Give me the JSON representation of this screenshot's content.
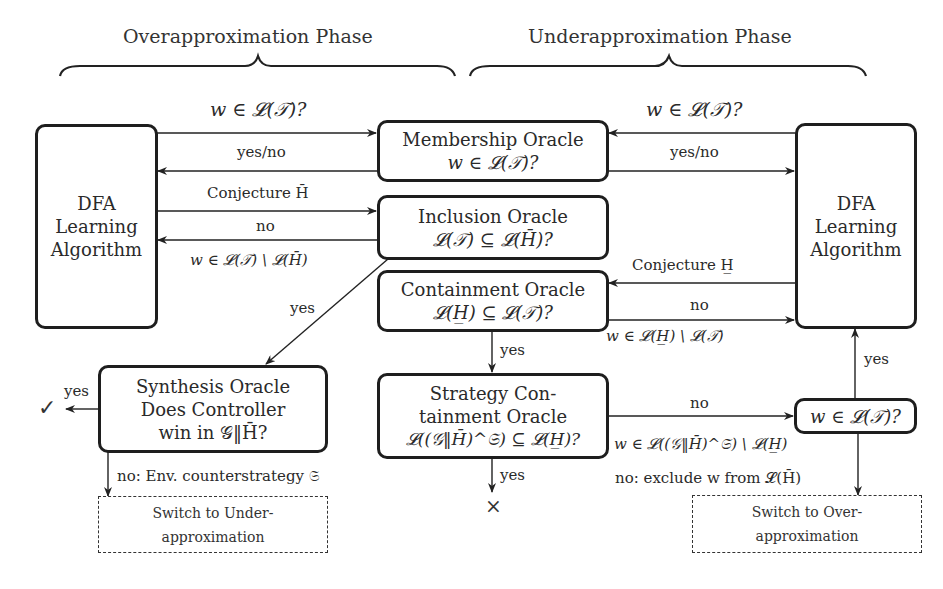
{
  "phases": {
    "over": "Overapproximation Phase",
    "under": "Underapproximation Phase"
  },
  "boxes": {
    "dfa_left": [
      "DFA",
      "Learning",
      "Algorithm"
    ],
    "dfa_right": [
      "DFA",
      "Learning",
      "Algorithm"
    ],
    "membership": [
      "Membership Oracle",
      "w ∈ 𝓛(𝒯)?"
    ],
    "inclusion": [
      "Inclusion Oracle",
      "𝓛(𝒯) ⊆ 𝓛(H̄)?"
    ],
    "containment": [
      "Containment Oracle",
      "𝓛(H̲) ⊆ 𝓛(𝒯)?"
    ],
    "synthesis": [
      "Synthesis Oracle",
      "Does Controller",
      "win in 𝒢‖H̄?"
    ],
    "strategy": [
      "Strategy Con-",
      "tainment Oracle",
      "𝓛((𝒢‖H̄)^𝔖) ⊆ 𝓛(H̲)?"
    ],
    "membership_check": "w ∈ 𝓛(𝒯)?",
    "switch_under": [
      "Switch to Under-",
      "approximation"
    ],
    "switch_over": [
      "Switch to Over-",
      "approximation"
    ]
  },
  "edges": {
    "left_query": "w ∈ 𝓛(𝒯)?",
    "left_yesno": "yes/no",
    "left_conjecture": "Conjecture H̄",
    "left_no": "no",
    "left_counterexample": "w ∈ 𝓛(𝒯) \\ 𝓛(H̄)",
    "inclusion_yes": "yes",
    "right_query": "w ∈ 𝓛(𝒯)?",
    "right_yesno": "yes/no",
    "right_conjecture": "Conjecture H̲",
    "right_no": "no",
    "right_counterexample": "w ∈ 𝓛(H̲) \\ 𝓛(𝒯)",
    "containment_yes": "yes",
    "synthesis_yes": "yes",
    "synthesis_no": "no: Env. counterstrategy 𝔖",
    "strategy_no": "no",
    "strategy_counterexample": "w ∈ 𝓛((𝒢‖H̄)^𝔖) \\ 𝓛(H̲)",
    "strategy_yes": "yes",
    "check_yes": "yes",
    "check_no": "no: exclude w from 𝓛(H̄)"
  },
  "symbols": {
    "success": "✓",
    "failure": "×"
  }
}
